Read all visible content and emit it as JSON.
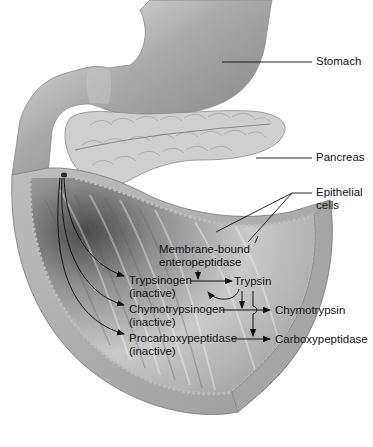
{
  "diagram": {
    "organs": {
      "stomach": "Stomach",
      "pancreas": "Pancreas",
      "epithelial": [
        "Epithelial",
        "cells"
      ]
    },
    "enzyme": {
      "activator": [
        "Membrane-bound",
        "enteropeptidase"
      ],
      "trypsinogen": "Trypsinogen",
      "chymotrypsinogen": "Chymotrypsinogen",
      "procarboxypeptidase": "Procarboxypeptidase",
      "inactive": "(inactive)",
      "trypsin": "Trypsin",
      "chymotrypsin": "Chymotrypsin",
      "carboxypeptidase": "Carboxypeptidase"
    },
    "colors": {
      "background": "#ffffff",
      "tissue_light": "#d8d8d8",
      "tissue_mid": "#a9a9a9",
      "tissue_dark": "#6a6a6a",
      "lines": "#111111"
    }
  }
}
